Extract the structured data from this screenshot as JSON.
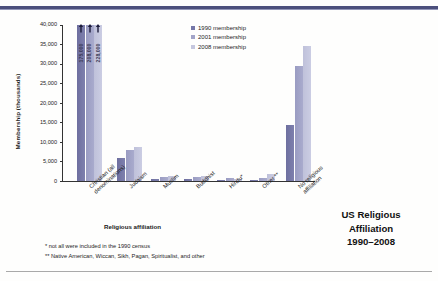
{
  "title_block": {
    "line1": "US Religious",
    "line2": "Affiliation",
    "line3": "1990–2008"
  },
  "footnotes": {
    "one": "* not all were included in the 1990 census",
    "two": "** Native American, Wiccan, Sikh, Pagan, Spiritualist, and other"
  },
  "colors": {
    "series_1990": "#7577a8",
    "series_2001": "#a2a4c8",
    "series_2008": "#c5c7de",
    "rule_top": "#4b4f7c",
    "rule_bottom": "#a9a9a9",
    "axis": "#333333",
    "background": "#fefefd"
  },
  "chart_data": {
    "type": "bar",
    "title": "US Religious Affiliation 1990–2008",
    "xlabel": "Religious affiliation",
    "ylabel": "Membership (thousands)",
    "ylim": [
      0,
      40000
    ],
    "yticks": [
      "0",
      "5,000",
      "10,000",
      "15,000",
      "20,000",
      "25,000",
      "30,000",
      "35,000",
      "40,000"
    ],
    "ytick_values": [
      0,
      5000,
      10000,
      15000,
      20000,
      25000,
      30000,
      35000,
      40000
    ],
    "grid": false,
    "legend_position": "top-center",
    "categories": [
      "Christian (all\ndenominations)",
      "Judaism",
      "Muslim",
      "Buddhist",
      "Hindu*",
      "Other **",
      "No religious\naffiliation"
    ],
    "series": [
      {
        "name": "1990 membership",
        "color": "#7577a8",
        "values": [
          175000,
          6000,
          500,
          400,
          200,
          100,
          14400
        ]
      },
      {
        "name": "2001 membership",
        "color": "#a2a4c8",
        "values": [
          208000,
          7800,
          1100,
          1100,
          800,
          800,
          29500
        ]
      },
      {
        "name": "2008 membership",
        "color": "#c5c7de",
        "values": [
          228000,
          8800,
          1350,
          1200,
          600,
          1800,
          34500
        ]
      }
    ],
    "annotations": [
      {
        "category": "Christian (all denominations)",
        "series": "1990 membership",
        "label": "175,000",
        "note": "bar truncated, arrow marker"
      },
      {
        "category": "Christian (all denominations)",
        "series": "2001 membership",
        "label": "208,000",
        "note": "bar truncated, arrow marker"
      },
      {
        "category": "Christian (all denominations)",
        "series": "2008 membership",
        "label": "228,000",
        "note": "bar truncated, arrow marker"
      }
    ]
  }
}
